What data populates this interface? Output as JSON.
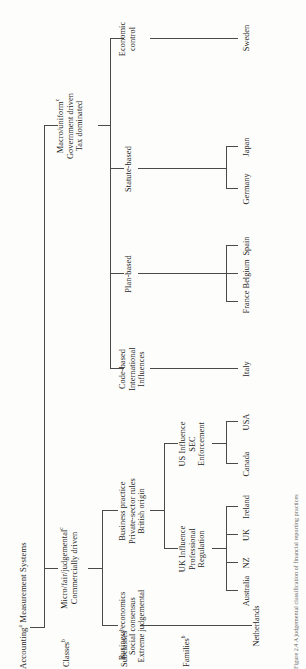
{
  "figure": {
    "title_sup": "a",
    "caption": "Figure 2.4  A judgemental classification of financial reporting practices"
  },
  "row_labels": [
    {
      "id": "classes",
      "text": "Classes",
      "sup": "b"
    },
    {
      "id": "subclasses",
      "text": "Subclasses",
      "sup": "b"
    },
    {
      "id": "families",
      "text": "Families",
      "sup": "b"
    }
  ],
  "classes": [
    {
      "id": "micro",
      "lines": [
        "Micro/fair/judgemental",
        "Commercially driven"
      ],
      "sup": "c"
    },
    {
      "id": "macro",
      "lines": [
        "Macro/uniform",
        "Government driven",
        "Tax dominated"
      ],
      "sup": "c"
    }
  ],
  "subclasses": [
    {
      "id": "business-economics",
      "parent": "micro",
      "lines": [
        "Business economics",
        "Social consensus",
        "Extreme judgemental"
      ]
    },
    {
      "id": "business-practice",
      "parent": "micro",
      "lines": [
        "Business practice",
        "Private-sector rules",
        "British origin"
      ]
    },
    {
      "id": "code-based",
      "parent": "macro",
      "lines": [
        "Code-based",
        "International",
        "Influences"
      ]
    },
    {
      "id": "plan-based",
      "parent": "macro",
      "lines": [
        "Plan-based"
      ]
    },
    {
      "id": "statute-based",
      "parent": "macro",
      "lines": [
        "Statute-based"
      ]
    },
    {
      "id": "economic-control",
      "parent": "macro",
      "lines": [
        "Economic",
        "control"
      ]
    }
  ],
  "families": [
    {
      "id": "netherlands",
      "parent": "business-economics",
      "lines": [
        "Netherlands"
      ],
      "countries": []
    },
    {
      "id": "uk-influence",
      "parent": "business-practice",
      "lines": [
        "UK Influence",
        "Professional",
        "Regulation"
      ],
      "countries": [
        "Australia",
        "NZ",
        "UK",
        "Ireland"
      ]
    },
    {
      "id": "us-influence",
      "parent": "business-practice",
      "lines": [
        "US Influence",
        "SEC",
        "Enforcement"
      ],
      "countries": [
        "Canada",
        "USA"
      ]
    },
    {
      "id": "italy",
      "parent": "code-based",
      "lines": [],
      "countries": [
        "Italy"
      ]
    },
    {
      "id": "plan-countries",
      "parent": "plan-based",
      "lines": [],
      "countries": [
        "France",
        "Belgium",
        "Spain"
      ]
    },
    {
      "id": "statute-countries",
      "parent": "statute-based",
      "lines": [],
      "countries": [
        "Germany",
        "Japan"
      ]
    },
    {
      "id": "sweden",
      "parent": "economic-control",
      "lines": [],
      "countries": [
        "Sweden"
      ]
    }
  ],
  "leaf_countries": {
    "uk_influence": [
      "Australia",
      "NZ",
      "UK",
      "Ireland"
    ],
    "us_influence": [
      "Canada",
      "USA"
    ],
    "code_based": [
      "Italy"
    ],
    "plan_based": [
      "France",
      "Belgium",
      "Spain"
    ],
    "statute_based": [
      "Germany",
      "Japan"
    ],
    "economic_control": [
      "Sweden"
    ]
  },
  "colors": {
    "line": "#4a4a4a",
    "text": "#1d1d1d",
    "background": "#fdfdfb"
  }
}
